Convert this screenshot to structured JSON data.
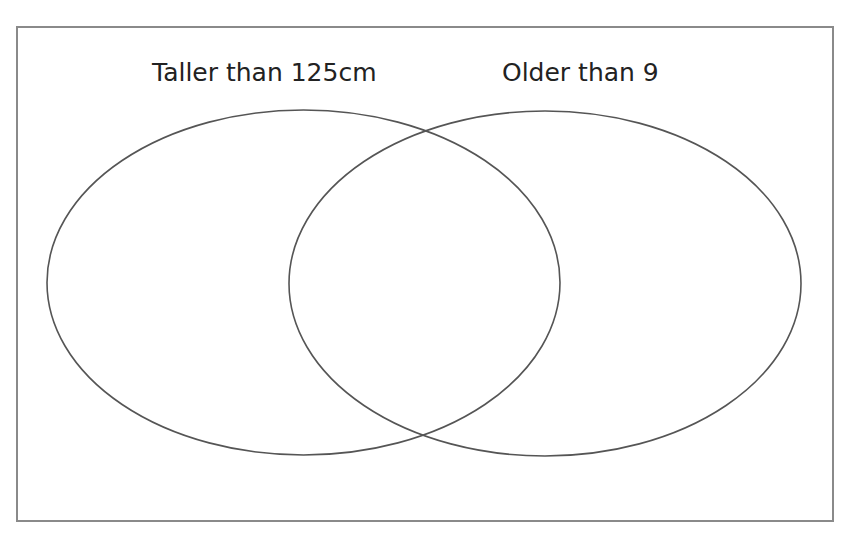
{
  "title": {
    "text": "",
    "note": "Title text is cropped off above the visible area; only descender fragments are visible"
  },
  "diagram": {
    "type": "venn",
    "frame": {
      "stroke": "#8a8a8a"
    },
    "stroke_color": "#555555",
    "sets": [
      {
        "id": "a",
        "label": "Taller than 125cm",
        "cx": 303.5,
        "cy": 282.5,
        "rx": 256.5,
        "ry": 172.5
      },
      {
        "id": "b",
        "label": "Older than 9",
        "cx": 545,
        "cy": 283.5,
        "rx": 256,
        "ry": 172.5
      }
    ],
    "regions": {
      "only_a": [],
      "both": [],
      "only_b": [],
      "neither": []
    }
  }
}
